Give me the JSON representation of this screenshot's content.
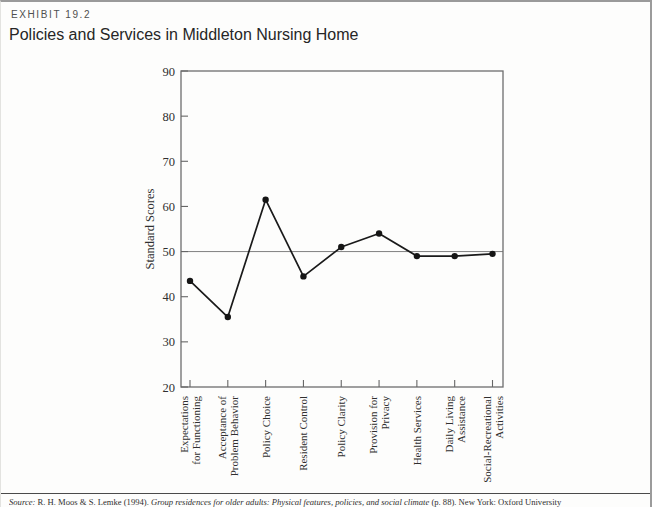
{
  "exhibit": {
    "label": "EXHIBIT 19.2",
    "title": "Policies and Services in Middleton Nursing Home"
  },
  "source": {
    "prefix_italic": "Source:",
    "authors": " R. H. Moos & S. Lemke (1994). ",
    "book_title_italic": "Group residences for older adults: Physical features, policies, and social climate",
    "suffix": " (p. 88). New York: Oxford University"
  },
  "chart_data": {
    "type": "line",
    "title": "",
    "xlabel": "",
    "ylabel": "Standard Scores",
    "ylim": [
      20,
      90
    ],
    "yticks": [
      20,
      30,
      40,
      50,
      60,
      70,
      80,
      90
    ],
    "reference_line": 50,
    "grid": false,
    "legend": "none",
    "categories": [
      "Expectations\nfor Functioning",
      "Acceptance of\nProblem Behavior",
      "Policy Choice",
      "Resident Control",
      "Policy Clarity",
      "Provision for\nPrivacy",
      "Health Services",
      "Daily Living\nAssistance",
      "Social-Recreational\nActivities"
    ],
    "values": [
      43.5,
      35.5,
      61.5,
      44.5,
      51,
      54,
      49,
      49,
      49.5
    ],
    "marker": "filled-circle",
    "colors": {
      "line": "#1a1a1a",
      "marker": "#151515",
      "frame": "#6e6e6e",
      "tick": "#666666",
      "reference_line": "#808080",
      "axis_text": "#2f2f2f"
    }
  }
}
